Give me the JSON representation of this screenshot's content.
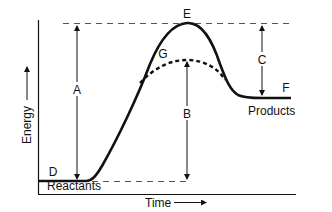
{
  "diagram": {
    "type": "reaction-energy-profile",
    "axes": {
      "y_label": "Energy",
      "x_label": "Time"
    },
    "labels": {
      "A": "A",
      "B": "B",
      "C": "C",
      "D": "D",
      "E": "E",
      "F": "F",
      "G": "G",
      "reactants": "Reactants",
      "products": "Products"
    },
    "curves": [
      {
        "name": "uncatalyzed-path",
        "style": "solid",
        "peak_label": "E"
      },
      {
        "name": "catalyzed-path",
        "style": "dashed",
        "peak_label": "G"
      }
    ],
    "arrows": [
      {
        "label": "A",
        "from": "reactants-level",
        "to": "peak-E",
        "direction": "double"
      },
      {
        "label": "B",
        "from": "peak-G",
        "to": "reactants-level",
        "direction": "down"
      },
      {
        "label": "C",
        "from": "peak-E",
        "to": "products-level",
        "direction": "double"
      }
    ],
    "colors": {
      "line": "#111111",
      "guide": "#333333",
      "background": "#ffffff"
    }
  }
}
